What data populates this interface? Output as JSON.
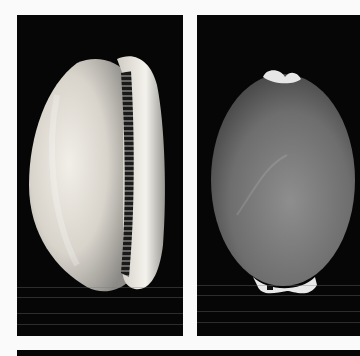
{
  "figure": {
    "panels": [
      {
        "id": "left",
        "view": "ventral (aperture) view",
        "shell_color": "#e8e4dc",
        "background": "#060606"
      },
      {
        "id": "right",
        "view": "dorsal view",
        "shell_color": "#7a7a7a",
        "background": "#060606"
      },
      {
        "id": "bottom",
        "view": "partial black panel",
        "background": "#060606"
      }
    ],
    "page_background": "#fafafa"
  }
}
